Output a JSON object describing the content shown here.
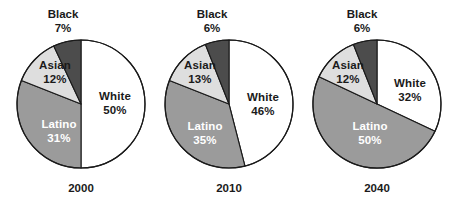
{
  "chart_data": [
    {
      "type": "pie",
      "title": "2000",
      "categories": [
        "White",
        "Latino",
        "Asian",
        "Black"
      ],
      "values": [
        50,
        31,
        12,
        7
      ],
      "value_labels": [
        "50%",
        "31%",
        "12%",
        "7%"
      ],
      "colors": [
        "#ffffff",
        "#9b9b9b",
        "#dedede",
        "#4c4c4c"
      ],
      "legend": "none",
      "grid": false,
      "units": "percent"
    },
    {
      "type": "pie",
      "title": "2010",
      "categories": [
        "White",
        "Latino",
        "Asian",
        "Black"
      ],
      "values": [
        46,
        35,
        13,
        6
      ],
      "value_labels": [
        "46%",
        "35%",
        "13%",
        "6%"
      ],
      "colors": [
        "#ffffff",
        "#9b9b9b",
        "#dedede",
        "#4c4c4c"
      ],
      "legend": "none",
      "grid": false,
      "units": "percent"
    },
    {
      "type": "pie",
      "title": "2040",
      "categories": [
        "White",
        "Latino",
        "Asian",
        "Black"
      ],
      "values": [
        32,
        50,
        12,
        6
      ],
      "value_labels": [
        "32%",
        "50%",
        "12%",
        "6%"
      ],
      "colors": [
        "#ffffff",
        "#9b9b9b",
        "#dedede",
        "#4c4c4c"
      ],
      "legend": "none",
      "grid": false,
      "units": "percent"
    }
  ],
  "figure": {
    "background": "#ffffff",
    "outline_color": "#1a1a1a"
  },
  "charts": [
    {
      "year_label": "2000",
      "slices": {
        "white": {
          "name": "White",
          "pct": "50%"
        },
        "latino": {
          "name": "Latino",
          "pct": "31%"
        },
        "asian": {
          "name": "Asian",
          "pct": "12%"
        },
        "black": {
          "name": "Black",
          "pct": "7%"
        }
      }
    },
    {
      "year_label": "2010",
      "slices": {
        "white": {
          "name": "White",
          "pct": "46%"
        },
        "latino": {
          "name": "Latino",
          "pct": "35%"
        },
        "asian": {
          "name": "Asian",
          "pct": "13%"
        },
        "black": {
          "name": "Black",
          "pct": "6%"
        }
      }
    },
    {
      "year_label": "2040",
      "slices": {
        "white": {
          "name": "White",
          "pct": "32%"
        },
        "latino": {
          "name": "Latino",
          "pct": "50%"
        },
        "asian": {
          "name": "Asian",
          "pct": "12%"
        },
        "black": {
          "name": "Black",
          "pct": "6%"
        }
      }
    }
  ]
}
